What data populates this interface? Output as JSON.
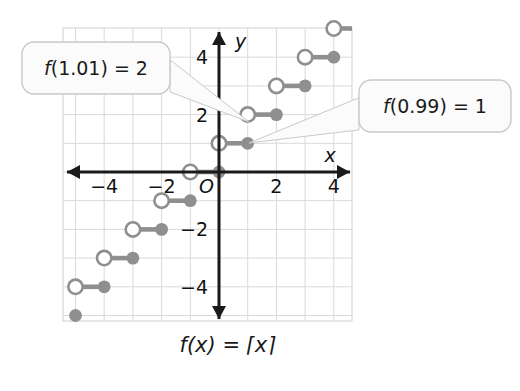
{
  "figure": {
    "caption": "f(x) = ⌈x⌉",
    "caption_parts": {
      "fx": "f(x)",
      "eq": "=",
      "ceil": "⌈x⌉"
    }
  },
  "callouts": [
    {
      "id": "callout-upper-left",
      "text": "f(1.01) = 2",
      "fn": "f",
      "arg": "(1.01)",
      "eq": "=",
      "value": "2",
      "box": {
        "x": 22,
        "y": 42,
        "w": 148,
        "h": 52,
        "radius": 12
      },
      "tail_tip": {
        "x": 249,
        "y": 122
      }
    },
    {
      "id": "callout-right",
      "text": "f(0.99) = 1",
      "fn": "f",
      "arg": "(0.99)",
      "eq": "=",
      "value": "1",
      "box": {
        "x": 359,
        "y": 80,
        "w": 152,
        "h": 52,
        "radius": 12
      },
      "tail_tip": {
        "x": 249,
        "y": 143
      }
    }
  ],
  "axes": {
    "x_label": "x",
    "y_label": "y",
    "origin_label": "O",
    "x_ticks": [
      {
        "value": -4,
        "label": "−4"
      },
      {
        "value": -2,
        "label": "−2"
      },
      {
        "value": 2,
        "label": "2"
      },
      {
        "value": 4,
        "label": "4"
      }
    ],
    "y_ticks": [
      {
        "value": 4,
        "label": "4"
      },
      {
        "value": 2,
        "label": "2"
      },
      {
        "value": -2,
        "label": "−2"
      },
      {
        "value": -4,
        "label": "−4"
      }
    ]
  },
  "colors": {
    "grid": "#d9d9d9",
    "grid_border": "#cccccc",
    "axis": "#1a1a1a",
    "step": "#8f8f8f",
    "step_open_fill": "#ffffff",
    "callout_fill": "#fbfbfb",
    "callout_stroke": "#c9c9c9",
    "text": "#111111",
    "background": "#ffffff"
  },
  "chart_data": {
    "type": "line",
    "title": "",
    "subtitle": "",
    "xlabel": "x",
    "ylabel": "y",
    "xlim": [
      -5.45,
      4.65
    ],
    "ylim": [
      -5.2,
      5.0
    ],
    "grid": true,
    "legend": null,
    "function_name": "ceiling",
    "function_expression": "f(x) = ceil(x)",
    "step_segments": [
      {
        "x_start": -5,
        "x_end": -4,
        "y": -4,
        "left_endpoint": "open",
        "right_endpoint": "closed"
      },
      {
        "x_start": -4,
        "x_end": -3,
        "y": -3,
        "left_endpoint": "open",
        "right_endpoint": "closed"
      },
      {
        "x_start": -3,
        "x_end": -2,
        "y": -2,
        "left_endpoint": "open",
        "right_endpoint": "closed"
      },
      {
        "x_start": -2,
        "x_end": -1,
        "y": -1,
        "left_endpoint": "open",
        "right_endpoint": "closed"
      },
      {
        "x_start": -1,
        "x_end": 0,
        "y": 0,
        "left_endpoint": "open",
        "right_endpoint": "closed"
      },
      {
        "x_start": 0,
        "x_end": 1,
        "y": 1,
        "left_endpoint": "open",
        "right_endpoint": "closed"
      },
      {
        "x_start": 1,
        "x_end": 2,
        "y": 2,
        "left_endpoint": "open",
        "right_endpoint": "closed"
      },
      {
        "x_start": 2,
        "x_end": 3,
        "y": 3,
        "left_endpoint": "open",
        "right_endpoint": "closed"
      },
      {
        "x_start": 3,
        "x_end": 4,
        "y": 4,
        "left_endpoint": "open",
        "right_endpoint": "closed"
      },
      {
        "x_start": 4,
        "x_end": 5,
        "y": 5,
        "left_endpoint": "open",
        "right_endpoint": "closed"
      }
    ],
    "extra_points": [
      {
        "x": -5,
        "y": -5,
        "style": "closed",
        "note": "right endpoint of segment below the visible window"
      }
    ],
    "annotations": [
      {
        "text": "f(1.01) = 2",
        "points_to": {
          "x": 1.04,
          "y": 1.72
        }
      },
      {
        "text": "f(0.99) = 1",
        "points_to": {
          "x": 1.04,
          "y": 1.0
        }
      }
    ]
  },
  "geometry": {
    "grid": {
      "left": 63,
      "top": 28,
      "right": 352,
      "bottom": 321,
      "cell": 28.7
    },
    "origin": {
      "x": 219,
      "y": 172
    }
  }
}
